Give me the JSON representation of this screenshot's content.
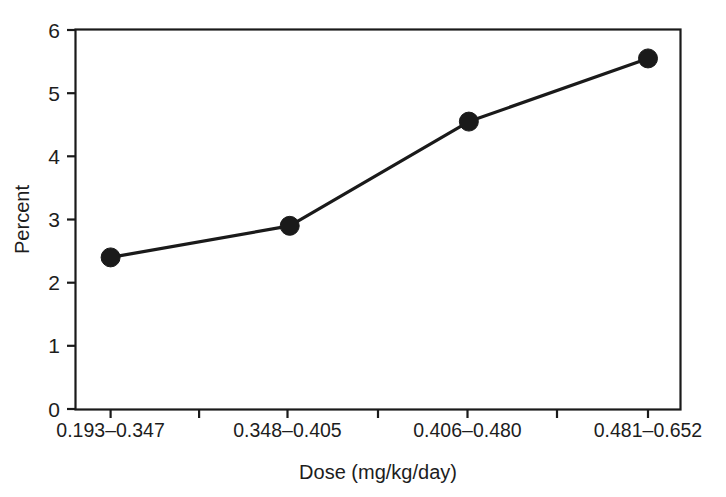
{
  "chart_data": {
    "type": "line",
    "title": "",
    "subtitle": "",
    "xlabel": "Dose (mg/kg/day)",
    "ylabel": "Percent",
    "categories": [
      "0.193–0.347",
      "0.348–0.405",
      "0.406–0.480",
      "0.481–0.652"
    ],
    "values": [
      2.4,
      2.9,
      4.55,
      5.55
    ],
    "series": [
      {
        "name": "Percent",
        "values": [
          2.4,
          2.9,
          4.55,
          5.55
        ]
      }
    ],
    "ylim": [
      0,
      6
    ],
    "yticks": [
      0,
      1,
      2,
      3,
      4,
      5,
      6
    ],
    "ytick_labels": [
      "0",
      "1",
      "2",
      "3",
      "4",
      "5",
      "6"
    ],
    "grid": false,
    "legend": "none",
    "marker": "filled-circle",
    "marker_color": "#1a1a1a",
    "line_color": "#1a1a1a",
    "line_width": 3,
    "axis_color": "#1a1a1a",
    "background": "#ffffff",
    "frame": "full-box",
    "tick_direction": "out"
  },
  "axes": {
    "y_title": "Percent",
    "x_title": "Dose (mg/kg/day)"
  }
}
